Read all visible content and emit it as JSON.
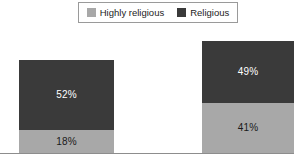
{
  "chart_data": {
    "type": "bar",
    "subtype": "stacked-column",
    "title": "",
    "subtitle": "",
    "xlabel": "",
    "ylabel": "",
    "categories": [
      "Group 1",
      "Group 2"
    ],
    "series": [
      {
        "name": "Religious",
        "values": [
          52,
          49
        ],
        "color": "#3a3a3a",
        "order": "top"
      },
      {
        "name": "Highly religious",
        "values": [
          18,
          41
        ],
        "color": "#a8a8a8",
        "order": "bottom"
      }
    ],
    "data_labels": [
      "52%",
      "18%",
      "49%",
      "41%"
    ],
    "totals": [
      70,
      90
    ],
    "ylim": [
      0,
      100
    ],
    "grid": false,
    "legend_position": "top-center",
    "axis_line": "bottom"
  },
  "legend": {
    "items": [
      {
        "label": "Highly religious",
        "color": "#a8a8a8",
        "swatch": "legend-swatch-light"
      },
      {
        "label": "Religious",
        "color": "#3a3a3a",
        "swatch": "legend-swatch-dark"
      }
    ]
  },
  "bars": [
    {
      "name": "bar-1",
      "segments": [
        {
          "series": "Religious",
          "value": 52,
          "label": "52%",
          "color": "#3a3a3a",
          "label_color": "#ffffff"
        },
        {
          "series": "Highly religious",
          "value": 18,
          "label": "18%",
          "color": "#a8a8a8",
          "label_color": "#1a1a1a"
        }
      ]
    },
    {
      "name": "bar-2",
      "segments": [
        {
          "series": "Religious",
          "value": 49,
          "label": "49%",
          "color": "#3a3a3a",
          "label_color": "#ffffff"
        },
        {
          "series": "Highly religious",
          "value": 41,
          "label": "41%",
          "color": "#a8a8a8",
          "label_color": "#1a1a1a"
        }
      ]
    }
  ],
  "colors": {
    "dark_gray": "#3a3a3a",
    "light_gray": "#a8a8a8",
    "axis": "#8d8d8d",
    "legend_border": "#9a9a9a",
    "background": "#ffffff"
  }
}
